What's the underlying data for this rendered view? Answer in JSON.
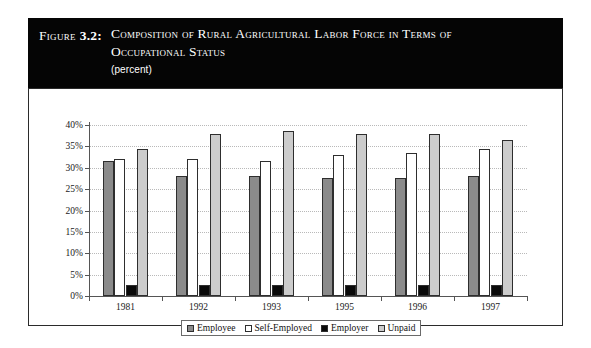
{
  "figure": {
    "label": "Figure",
    "number": "3.2:",
    "title_line1": "Composition of Rural Agricultural Labor Force in Terms of",
    "title_line2": "Occupational Status",
    "subtitle": "(percent)"
  },
  "chart_data": {
    "type": "bar",
    "title": "Composition of Rural Agricultural Labor Force in Terms of Occupational Status",
    "subtitle": "(percent)",
    "xlabel": "",
    "ylabel": "",
    "ylim": [
      0,
      40
    ],
    "ytick_values": [
      0,
      5,
      10,
      15,
      20,
      25,
      30,
      35,
      40
    ],
    "ytick_labels": [
      "0%",
      "5%",
      "10%",
      "15%",
      "20%",
      "25%",
      "30%",
      "35%",
      "40%"
    ],
    "grid": true,
    "legend_position": "bottom",
    "categories": [
      "1981",
      "1992",
      "1993",
      "1995",
      "1996",
      "1997"
    ],
    "series": [
      {
        "name": "Employee",
        "color": "#8b8b8b",
        "values": [
          31.5,
          28.0,
          28.0,
          27.5,
          27.5,
          28.0
        ]
      },
      {
        "name": "Self-Employed",
        "color": "#ffffff",
        "values": [
          32.0,
          32.0,
          31.5,
          33.0,
          33.5,
          34.5
        ]
      },
      {
        "name": "Employer",
        "color": "#0a0a0a",
        "values": [
          2.5,
          2.5,
          2.5,
          2.5,
          2.5,
          2.5
        ]
      },
      {
        "name": "Unpaid",
        "color": "#cccccc",
        "values": [
          34.5,
          38.0,
          38.5,
          38.0,
          38.0,
          36.5
        ]
      }
    ]
  }
}
